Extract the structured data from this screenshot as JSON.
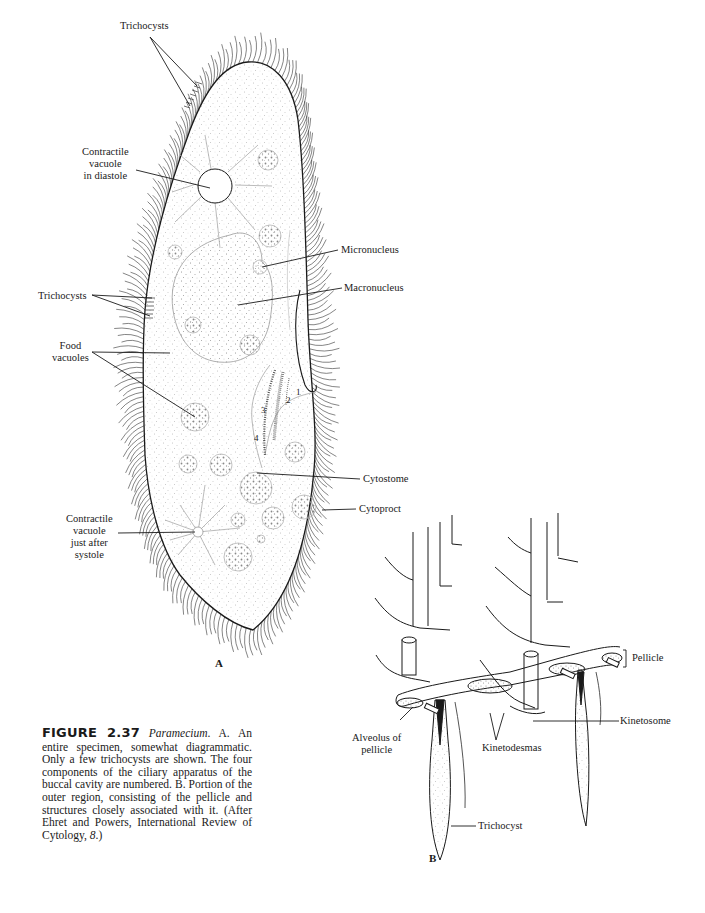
{
  "figure": {
    "number": "2.37",
    "label_prefix": "FIGURE",
    "species": "Paramecium",
    "caption_body": ". A. An entire specimen, somewhat diagrammatic. Only a few trichocysts are shown. The four components of the ciliary apparatus of the buccal cavity are numbered. B. Portion of the outer region, consisting of the pellicle and structures closely associated with it. (After Ehret and Powers, International Review of Cytology, ",
    "caption_volume": "8",
    "caption_end": ".)"
  },
  "panel_a": {
    "letter": "A",
    "labels": {
      "trichocysts_top": "Trichocysts",
      "contractile_vacuole_diastole": [
        "Contractile",
        "vacuole",
        "in diastole"
      ],
      "micronucleus": "Micronucleus",
      "macronucleus": "Macronucleus",
      "trichocysts_mid": "Trichocysts",
      "food_vacuoles": [
        "Food",
        "vacuoles"
      ],
      "cytostome": "Cytostome",
      "cytoproct": "Cytoproct",
      "contractile_vacuole_systole": [
        "Contractile",
        "vacuole",
        "just after",
        "systole"
      ]
    },
    "buccal_numbers": [
      "1",
      "2",
      "3",
      "4"
    ]
  },
  "panel_b": {
    "letter": "B",
    "labels": {
      "pellicle": "Pellicle",
      "kinetosome": "Kinetosome",
      "alveolus_of_pellicle": [
        "Alveolus of",
        "pellicle"
      ],
      "kinetodesmas": "Kinetodesmas",
      "trichocyst": "Trichocyst"
    }
  },
  "colors": {
    "ink": "#1a1a1a",
    "stipple": "#9a9a9a",
    "background": "#ffffff"
  }
}
